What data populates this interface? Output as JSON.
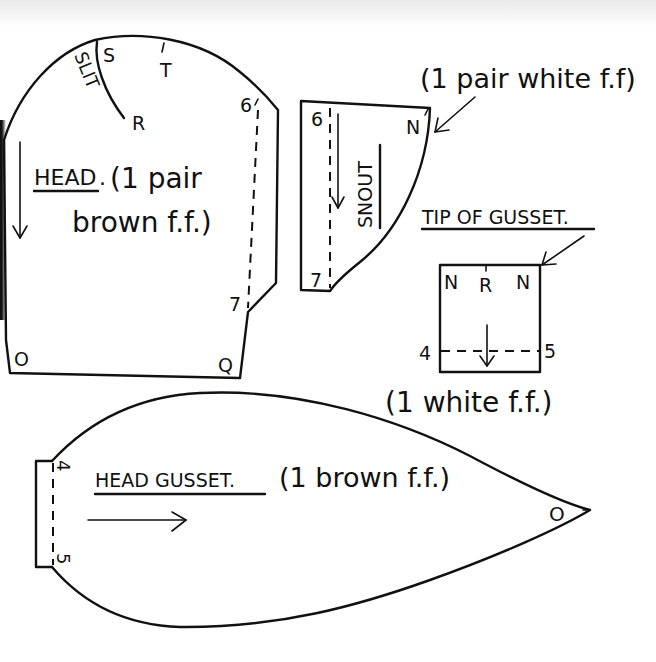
{
  "diagram": {
    "type": "sewing-pattern",
    "pieces": {
      "head": {
        "title": "HEAD",
        "title_punct": ".",
        "note_line1": "(1 pair",
        "note_line2": "brown  f.f.)",
        "slit_label": "SLIT",
        "points": {
          "s": "S",
          "t": "T",
          "r": "R",
          "six": "6",
          "seven": "7",
          "o": "O",
          "q": "Q"
        }
      },
      "snout": {
        "title": "SNOUT",
        "note": "(1 pair white f.f)",
        "points": {
          "six": "6",
          "seven": "7",
          "n": "N"
        }
      },
      "tip_of_gusset": {
        "title": "TIP OF GUSSET.",
        "note": "(1 white  f.f.)",
        "points": {
          "n_left": "N",
          "r": "R",
          "n_right": "N",
          "four": "4",
          "five": "5"
        }
      },
      "head_gusset": {
        "title": "HEAD GUSSET.",
        "note": "(1 brown f.f.)",
        "points": {
          "four": "4",
          "five": "5",
          "o": "O"
        }
      }
    },
    "legend": {
      "ff_meaning": "f.f. = fur fabric",
      "arrow_meaning": "arrow = direction of pile"
    },
    "colors": {
      "ink": "#111111",
      "paper": "#ffffff",
      "scan_band": "#ececec"
    }
  }
}
